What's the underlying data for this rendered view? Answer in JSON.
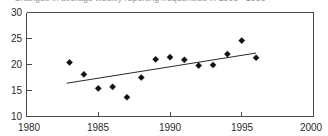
{
  "chart_data": {
    "type": "scatter",
    "title": "Changes in average weekly reporting frequencies in 1983 - 1996",
    "xlabel": "",
    "ylabel": "",
    "xlim": [
      1980,
      2000
    ],
    "ylim": [
      10,
      30
    ],
    "xticks": [
      1980,
      1985,
      1990,
      1995,
      2000
    ],
    "yticks": [
      10,
      15,
      20,
      25,
      30
    ],
    "grid": false,
    "legend": null,
    "x": [
      1983,
      1984,
      1985,
      1986,
      1987,
      1988,
      1989,
      1990,
      1991,
      1992,
      1993,
      1994,
      1995,
      1996
    ],
    "values": [
      20.4,
      18.1,
      15.4,
      15.7,
      13.7,
      17.5,
      21.0,
      21.4,
      20.9,
      19.8,
      19.9,
      22.0,
      24.6,
      21.3
    ],
    "series": [
      {
        "name": "Average weekly reporting frequency",
        "marker": "diamond",
        "color": "#111111",
        "values": [
          20.4,
          18.1,
          15.4,
          15.7,
          13.7,
          17.5,
          21.0,
          21.4,
          20.9,
          19.8,
          19.9,
          22.0,
          24.6,
          21.3
        ]
      },
      {
        "name": "Linear trend",
        "type": "line",
        "color": "#2a2a2a",
        "x": [
          1982.8,
          1996.0
        ],
        "values": [
          16.4,
          22.2
        ]
      }
    ]
  },
  "axis": {
    "y_tick_labels": [
      "30",
      "25",
      "20",
      "15",
      "10"
    ],
    "x_tick_labels": [
      "1980",
      "1985",
      "1990",
      "1995",
      "2000"
    ]
  }
}
